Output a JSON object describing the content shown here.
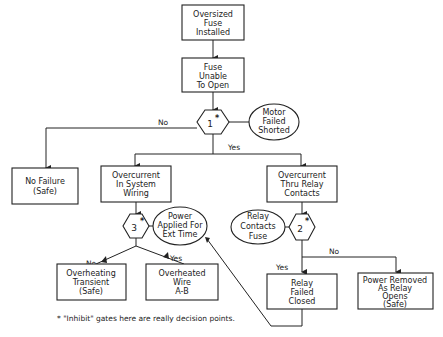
{
  "boxes": {
    "oversized_fuse": [
      "Oversized",
      "Fuse",
      "Installed"
    ],
    "fuse_unable": [
      "Fuse",
      "Unable",
      "To Open"
    ],
    "no_failure": [
      "No Failure",
      "(Safe)"
    ],
    "overcurrent_wiring": [
      "Overcurrent",
      "In System",
      "Wiring"
    ],
    "overcurrent_relay": [
      "Overcurrent",
      "Thru Relay",
      "Contacts"
    ],
    "overheating_transient": [
      "Overheating",
      "Transient",
      "(Safe)"
    ],
    "overheated_wire": [
      "Overheated",
      "Wire",
      "A-B"
    ],
    "relay_failed_closed": [
      "Relay",
      "Failed",
      "Closed"
    ],
    "power_removed": [
      "Power Removed",
      "As Relay",
      "Opens",
      "(Safe)"
    ]
  },
  "conditions": {
    "motor_failed": [
      "Motor",
      "Failed",
      "Shorted"
    ],
    "power_applied": [
      "Power",
      "Applied For",
      "Ext Time"
    ],
    "relay_contacts_fuse": [
      "Relay",
      "Contacts",
      "Fuse"
    ]
  },
  "gates": {
    "g1": {
      "number": "1",
      "mark": "*"
    },
    "g2": {
      "number": "2",
      "mark": "*"
    },
    "g3": {
      "number": "3",
      "mark": "*"
    }
  },
  "branch_labels": {
    "g1_no": "No",
    "g1_yes": "Yes",
    "g3_no": "No",
    "g3_yes": "Yes",
    "g2_no": "No",
    "g2_yes": "Yes"
  },
  "footnote": "* \"Inhibit\" gates here are really decision points."
}
